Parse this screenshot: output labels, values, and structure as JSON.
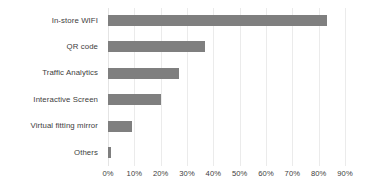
{
  "chart_data": {
    "type": "bar",
    "orientation": "horizontal",
    "title": "",
    "subtitle": "",
    "xlabel": "",
    "ylabel": "",
    "categories": [
      "In-store WIFI",
      "QR code",
      "Traffic Analytics",
      "Interactive Screen",
      "Virtual fitting mirror",
      "Others"
    ],
    "values": [
      83,
      37,
      27,
      20,
      9,
      1
    ],
    "value_suffix": "%",
    "xlim": [
      0,
      90
    ],
    "xticks": [
      0,
      10,
      20,
      30,
      40,
      50,
      60,
      70,
      80,
      90
    ],
    "xtick_labels": [
      "0%",
      "10%",
      "20%",
      "30%",
      "40%",
      "50%",
      "60%",
      "70%",
      "80%",
      "90%"
    ],
    "grid": "vertical",
    "legend": "none",
    "bar_color": "#7f7f7f",
    "gridline_color": "#ebebeb",
    "text_color": "#3d3d3d",
    "background_color": "#ffffff"
  }
}
